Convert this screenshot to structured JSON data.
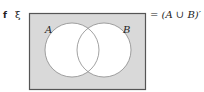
{
  "question": {
    "part_label": "f",
    "universal_set_symbol": "ξ",
    "equation": "= (A ∪ B)′"
  },
  "diagram": {
    "type": "venn",
    "sets": [
      {
        "label": "A",
        "shaded": false
      },
      {
        "label": "B",
        "shaded": false
      }
    ],
    "shaded_region": "outside A and B",
    "colors": {
      "shade": "#d9d9d9",
      "border": "#555555",
      "circle_stroke": "#8a8a8a",
      "circle_fill": "#ffffff"
    }
  }
}
